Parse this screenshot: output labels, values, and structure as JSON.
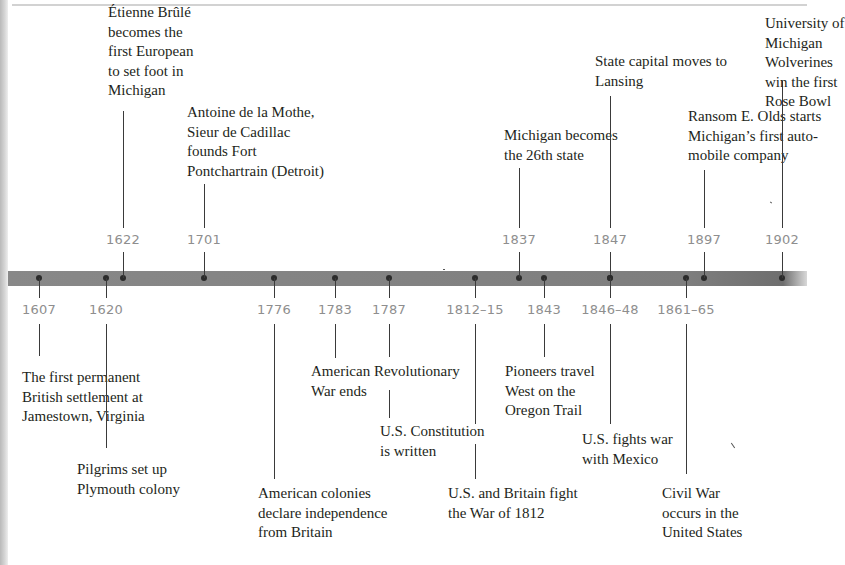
{
  "timeline": {
    "bar_color": "#828282",
    "dot_color": "#2b2b2b",
    "year_color": "#8e8e8e",
    "above": [
      {
        "year": "1622",
        "x": 123,
        "label": [
          "Étienne Brûlé",
          "becomes the",
          "first European",
          "to set foot in",
          "Michigan"
        ],
        "label_x": 108,
        "label_y": 3,
        "line_top": 111,
        "year_y": 232
      },
      {
        "year": "1701",
        "x": 204,
        "label": [
          "Antoine de la Mothe,",
          "Sieur de Cadillac",
          "founds Fort",
          "Pontchartrain (Detroit)"
        ],
        "label_x": 187,
        "label_y": 103,
        "line_top": 184,
        "year_y": 232
      },
      {
        "year": "1837",
        "x": 519,
        "label": [
          "Michigan becomes",
          "the 26th state"
        ],
        "label_x": 504,
        "label_y": 126,
        "line_top": 168,
        "year_y": 232
      },
      {
        "year": "1847",
        "x": 610,
        "label": [
          "State capital moves to",
          "Lansing"
        ],
        "label_x": 595,
        "label_y": 52,
        "line_top": 96,
        "year_y": 232
      },
      {
        "year": "1897",
        "x": 704,
        "label": [
          "Ransom E. Olds starts",
          "Michigan’s first auto-",
          "mobile company"
        ],
        "label_x": 688,
        "label_y": 107,
        "line_top": 170,
        "year_y": 232
      },
      {
        "year": "1902",
        "x": 782,
        "label": [
          "University of",
          "Michigan",
          "Wolverines",
          "win the first",
          "Rose Bowl"
        ],
        "label_x": 765,
        "label_y": 14,
        "line_top": 81,
        "year_y": 232
      }
    ],
    "below": [
      {
        "year": "1607",
        "x": 39,
        "label": [
          "The first permanent",
          "British settlement at",
          "Jamestown, Virginia"
        ],
        "label_x": 22,
        "label_y": 368,
        "line_bottom": 356
      },
      {
        "year": "1620",
        "x": 106,
        "label": [
          "Pilgrims set up",
          "Plymouth colony"
        ],
        "label_x": 77,
        "label_y": 460,
        "line_bottom": 448
      },
      {
        "year": "1776",
        "x": 274,
        "label": [
          "American colonies",
          "declare independence",
          "from Britain"
        ],
        "label_x": 258,
        "label_y": 484,
        "line_bottom": 479
      },
      {
        "year": "1783",
        "x": 335,
        "label": [
          "American Revolutionary",
          "War ends"
        ],
        "label_x": 311,
        "label_y": 362,
        "line_bottom": 358
      },
      {
        "year": "1787",
        "x": 389,
        "label": [
          "U.S. Constitution",
          "is written"
        ],
        "label_x": 380,
        "label_y": 422,
        "line_bottom": 357,
        "line2_top": 390,
        "line2_bottom": 418
      },
      {
        "year": "1812–15",
        "x": 475,
        "label": [
          "U.S. and Britain fight",
          "the War of 1812"
        ],
        "label_x": 448,
        "label_y": 484,
        "line_bottom": 424,
        "line2_top": 444,
        "line2_bottom": 479
      },
      {
        "year": "1843",
        "x": 544,
        "label": [
          "Pioneers travel",
          "West on the",
          "Oregon Trail"
        ],
        "label_x": 505,
        "label_y": 362,
        "line_bottom": 357
      },
      {
        "year": "1846–48",
        "x": 610,
        "label": [
          "U.S. fights war",
          "with Mexico"
        ],
        "label_x": 582,
        "label_y": 430,
        "line_bottom": 424
      },
      {
        "year": "1861–65",
        "x": 686,
        "label": [
          "Civil War",
          "occurs in the",
          "United States"
        ],
        "label_x": 662,
        "label_y": 484,
        "line_bottom": 474
      }
    ]
  }
}
